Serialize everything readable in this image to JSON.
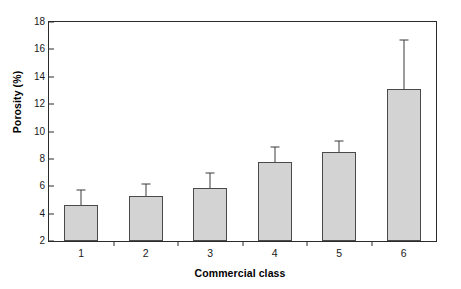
{
  "chart_data": {
    "type": "bar",
    "title": "",
    "xlabel": "Commercial class",
    "ylabel": "Porosity (%)",
    "categories": [
      "1",
      "2",
      "3",
      "4",
      "5",
      "6"
    ],
    "values": [
      4.6,
      5.3,
      5.9,
      7.8,
      8.5,
      13.1
    ],
    "errors_upper": [
      5.7,
      6.2,
      7.0,
      8.9,
      9.3,
      16.7
    ],
    "ylim": [
      2,
      18
    ],
    "yticks": [
      2,
      4,
      6,
      8,
      10,
      12,
      14,
      16,
      18
    ],
    "ytick_labels": [
      "2",
      "4",
      "6",
      "8",
      "10",
      "12",
      "14",
      "16",
      "18"
    ],
    "xtick_labels": [
      "1",
      "2",
      "3",
      "4",
      "5",
      "6"
    ],
    "grid": false,
    "legend": null,
    "bar_fill_color": "#d3d3d3",
    "bar_edge_color": "#4a4a4a",
    "axis_color": "#2b2b2b",
    "error_bar_color": "#3a3a3a",
    "background_color": "#ffffff",
    "error_bar_style": "upper-whisker-only"
  }
}
